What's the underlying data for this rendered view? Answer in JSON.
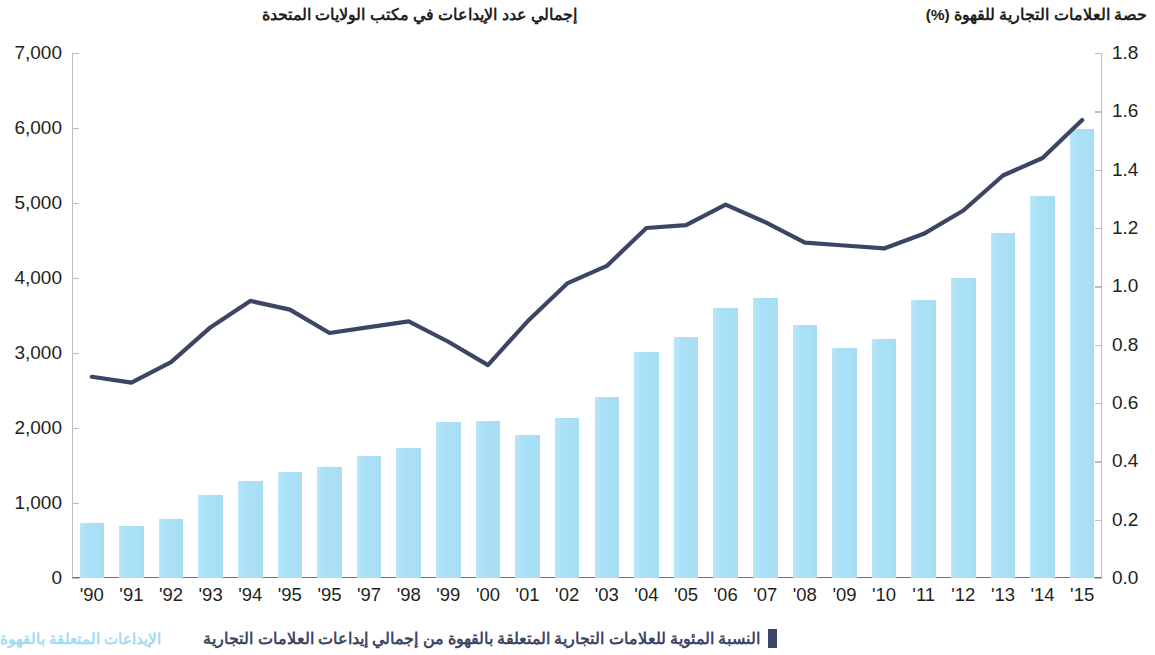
{
  "left_axis_title": "إجمالي عدد الإيداعات في مكتب الولايات المتحدة",
  "right_axis_title": "حصة العلامات التجارية للقهوة (%)",
  "legend": {
    "bars_label": "الإيداعات المتعلقة بالقهوة",
    "line_label": "النسبة المئوية للعلامات التجارية المتعلقة بالقهوة من إجمالي إيداعات العلامات التجارية"
  },
  "colors": {
    "bar_fill": "#a9e0f5",
    "line_stroke": "#3d4565",
    "axis_line": "#b9bcc0",
    "text": "#231f20",
    "legend_bars_text": "#9fdbf2"
  },
  "chart_data": {
    "type": "bar",
    "title": "",
    "subtitle": "",
    "xlabel": "",
    "ylabel": "إجمالي عدد الإيداعات في مكتب الولايات المتحدة",
    "y2label": "حصة العلامات التجارية للقهوة (%)",
    "ylim": [
      0,
      7000
    ],
    "y2lim": [
      0.0,
      1.8
    ],
    "grid": false,
    "legend_position": "bottom-right",
    "categories": [
      "'90",
      "'91",
      "'92",
      "'93",
      "'94",
      "'95",
      "'95",
      "'97",
      "'98",
      "'99",
      "'00",
      "'01",
      "'02",
      "'03",
      "'04",
      "'05",
      "'06",
      "'07",
      "'08",
      "'09",
      "'10",
      "'11",
      "'12",
      "'13",
      "'14",
      "'15"
    ],
    "ytick_labels": [
      "0",
      "1,000",
      "2,000",
      "3,000",
      "4,000",
      "5,000",
      "6,000",
      "7,000"
    ],
    "ytick_values": [
      0,
      1000,
      2000,
      3000,
      4000,
      5000,
      6000,
      7000
    ],
    "y2tick_labels": [
      "0.0",
      "0.2",
      "0.4",
      "0.6",
      "0.8",
      "1.0",
      "1.2",
      "1.4",
      "1.6",
      "1.8"
    ],
    "y2tick_values": [
      0.0,
      0.2,
      0.4,
      0.6,
      0.8,
      1.0,
      1.2,
      1.4,
      1.6,
      1.8
    ],
    "series": [
      {
        "name": "الإيداعات المتعلقة بالقهوة",
        "type": "bar",
        "axis": "left",
        "values": [
          740,
          700,
          790,
          1110,
          1290,
          1420,
          1480,
          1630,
          1740,
          2080,
          2090,
          1910,
          2140,
          2410,
          3010,
          3220,
          3600,
          3740,
          3380,
          3070,
          3190,
          3710,
          4000,
          4600,
          5100,
          5990
        ]
      },
      {
        "name": "النسبة المئوية للعلامات التجارية المتعلقة بالقهوة من إجمالي إيداعات العلامات التجارية",
        "type": "line",
        "axis": "right",
        "values": [
          0.69,
          0.67,
          0.74,
          0.86,
          0.95,
          0.92,
          0.84,
          0.86,
          0.88,
          0.81,
          0.73,
          0.88,
          1.01,
          1.07,
          1.2,
          1.21,
          1.28,
          1.22,
          1.15,
          1.14,
          1.13,
          1.18,
          1.26,
          1.38,
          1.44,
          1.57
        ]
      }
    ]
  }
}
